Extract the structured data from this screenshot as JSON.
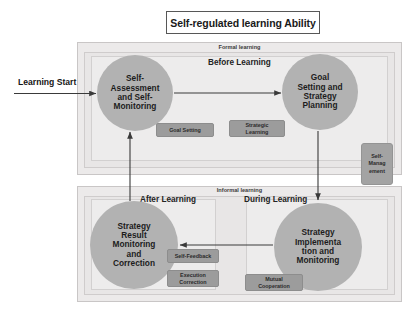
{
  "diagram": {
    "title": "Self-regulated learning Ability",
    "entry_label": "Learning Start"
  },
  "panels": {
    "formal": {
      "caption": "Formal learning",
      "phase": "Before Learning"
    },
    "informal": {
      "caption": "Informal learning",
      "phase_left": "After Learning",
      "phase_right": "During Learning"
    }
  },
  "nodes": {
    "self_assessment": "Self-\nAssessment\nand Self-\nMonitoring",
    "goal_setting": "Goal\nSetting and\nStrategy\nPlanning",
    "strategy_result": "Strategy\nResult\nMonitoring\nand\nCorrection",
    "strategy_implementation": "Strategy\nImplementa\ntion and\nMonitoring"
  },
  "chips": {
    "goal_setting": "Goal Setting",
    "strategic_learning": "Strategic\nLearning",
    "self_feedback": "Self-Feedback",
    "execution_correction": "Execution\nCorrection",
    "mutual_cooperation": "Mutual\nCooperation",
    "self_management": "Self-\nManag\nement"
  },
  "colors": {
    "node_fill": "#b2b2b2",
    "chip_fill": "#9c9c9c",
    "panel_fill": "#eceaea",
    "arrow": "#3a3a3a",
    "title_border": "#575757"
  }
}
